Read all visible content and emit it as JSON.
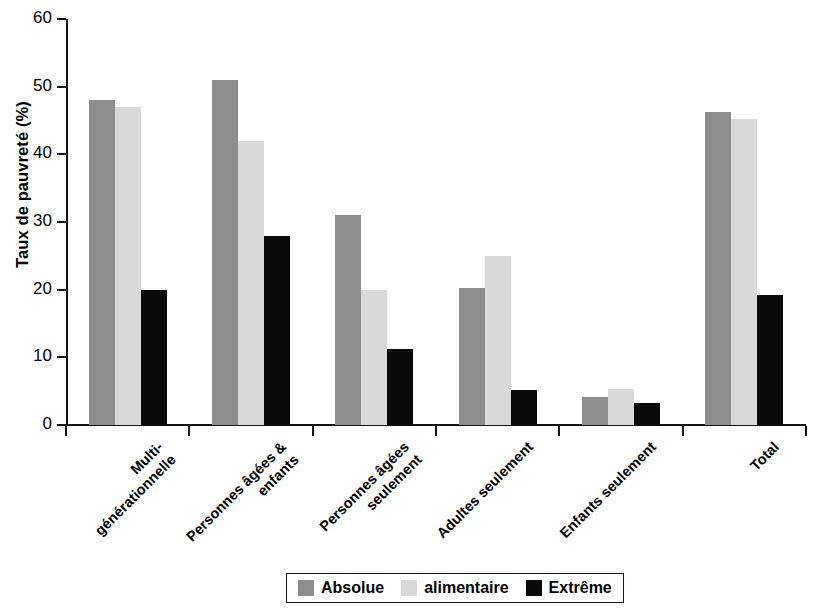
{
  "chart_data": {
    "type": "bar",
    "title": "",
    "xlabel": "",
    "ylabel": "Taux de pauvreté (%)",
    "ylim": [
      0,
      60
    ],
    "yticks": [
      0,
      10,
      20,
      30,
      40,
      50,
      60
    ],
    "grid": false,
    "legend_position": "bottom",
    "categories": [
      "Multi-\ngénérationnelle",
      "Personnes âgées &\nenfants",
      "Personnes âgées\nseulement",
      "Adultes seulement",
      "Enfants seulement",
      "Total"
    ],
    "series": [
      {
        "name": "Absolue",
        "color": "#8d8d8d",
        "values": [
          48,
          51,
          31,
          20.3,
          4.2,
          46.2
        ]
      },
      {
        "name": "alimentaire",
        "color": "#d9d9d9",
        "values": [
          47,
          42,
          20,
          25,
          5.3,
          45.2
        ]
      },
      {
        "name": "Extrême",
        "color": "#0a0a0a",
        "values": [
          20,
          28,
          11.2,
          5.2,
          3.2,
          19.2
        ]
      }
    ]
  },
  "axes": {
    "y_title": "Taux de pauvreté (%)",
    "y_tick_labels": [
      "0",
      "10",
      "20",
      "30",
      "40",
      "50",
      "60"
    ]
  },
  "legend": {
    "entries": [
      {
        "label": "Absolue",
        "color": "#8d8d8d"
      },
      {
        "label": "alimentaire",
        "color": "#d9d9d9"
      },
      {
        "label": "Extrême",
        "color": "#0a0a0a"
      }
    ]
  }
}
